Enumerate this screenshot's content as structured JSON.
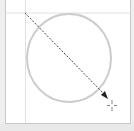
{
  "canvas": {
    "background": "#ffffff",
    "frame_color": "#c8c8c8",
    "guide_color": "#e2e2e2",
    "shape_stroke": "#cccccc",
    "arrow_color": "#444444"
  },
  "tool": {
    "active": "line-arrow-tool",
    "cursor_icon": "crosshair-icon"
  },
  "shapes": [
    {
      "type": "circle",
      "label": "circle-shape"
    },
    {
      "type": "arrow",
      "style": "dashed",
      "label": "drag-arrow"
    }
  ]
}
